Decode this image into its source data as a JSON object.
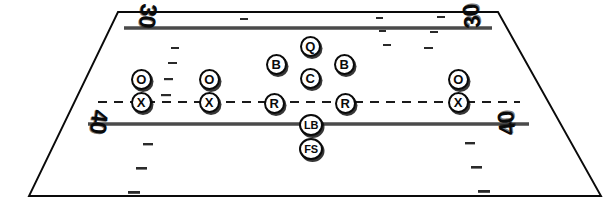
{
  "diagram": {
    "field": {
      "perspective": "trapezoid",
      "background_color": "#ffffff",
      "line_color": "#3d3d3d",
      "border_color": "#0a0a0a"
    },
    "yard_numbers": [
      {
        "name": "yard-number-30-left",
        "label": "30"
      },
      {
        "name": "yard-number-30-right",
        "label": "30"
      },
      {
        "name": "yard-number-40-left",
        "label": "40"
      },
      {
        "name": "yard-number-40-right",
        "label": "40"
      }
    ],
    "lines": [
      {
        "name": "yard-line-30",
        "style": "solid"
      },
      {
        "name": "line-of-scrimmage",
        "style": "dashed"
      },
      {
        "name": "yard-line-40",
        "style": "solid"
      },
      {
        "name": "sideline-bottom",
        "style": "solid"
      }
    ],
    "players": [
      {
        "name": "player-o-left-outer",
        "label": "O",
        "x": 141,
        "y": 79,
        "size": "std"
      },
      {
        "name": "player-x-left-outer",
        "label": "X",
        "x": 141,
        "y": 102,
        "size": "std"
      },
      {
        "name": "player-o-left-inner",
        "label": "O",
        "x": 209,
        "y": 79,
        "size": "std"
      },
      {
        "name": "player-x-left-inner",
        "label": "X",
        "x": 209,
        "y": 102,
        "size": "std"
      },
      {
        "name": "player-b-left",
        "label": "B",
        "x": 276,
        "y": 64,
        "size": "std"
      },
      {
        "name": "player-q-quarterback",
        "label": "Q",
        "x": 310,
        "y": 46,
        "size": "std"
      },
      {
        "name": "player-c-center",
        "label": "C",
        "x": 310,
        "y": 78,
        "size": "std"
      },
      {
        "name": "player-b-right",
        "label": "B",
        "x": 344,
        "y": 64,
        "size": "std"
      },
      {
        "name": "player-r-left",
        "label": "R",
        "x": 274,
        "y": 103,
        "size": "std"
      },
      {
        "name": "player-r-right",
        "label": "R",
        "x": 345,
        "y": 103,
        "size": "std"
      },
      {
        "name": "player-lb-linebacker",
        "label": "LB",
        "x": 311,
        "y": 125,
        "size": "wide"
      },
      {
        "name": "player-fs-freesafety",
        "label": "FS",
        "x": 311,
        "y": 149,
        "size": "wide"
      },
      {
        "name": "player-o-right",
        "label": "O",
        "x": 458,
        "y": 79,
        "size": "std"
      },
      {
        "name": "player-x-right",
        "label": "X",
        "x": 458,
        "y": 102,
        "size": "std"
      }
    ]
  }
}
